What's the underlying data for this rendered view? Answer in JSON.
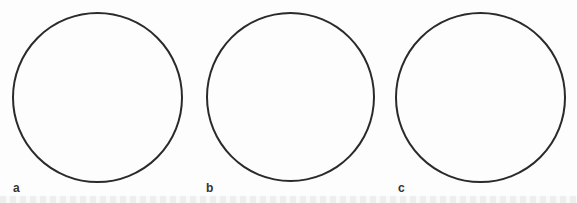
{
  "figure": {
    "panels": [
      {
        "label": "a",
        "circle": {
          "cx": 97,
          "cy": 97,
          "r": 85
        }
      },
      {
        "label": "b",
        "circle": {
          "cx": 290,
          "cy": 97,
          "r": 84
        }
      },
      {
        "label": "c",
        "circle": {
          "cx": 480,
          "cy": 98,
          "r": 85
        }
      }
    ],
    "stroke_color": "#2a2a2a",
    "background_color": "#fdfdfd"
  }
}
